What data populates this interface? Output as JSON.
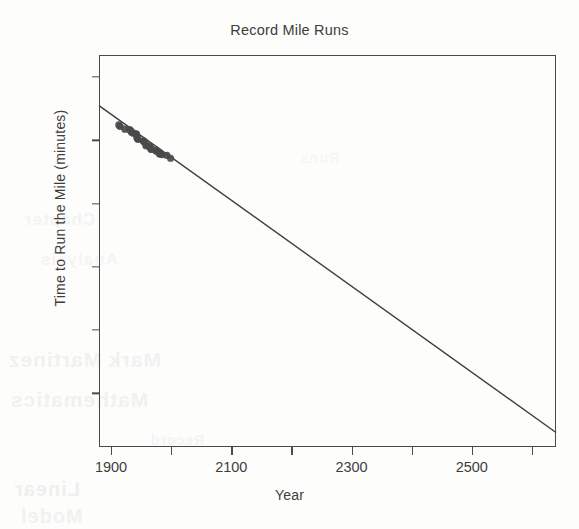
{
  "chart_data": {
    "type": "scatter",
    "title": "Record Mile Runs",
    "xlabel": "Year",
    "ylabel": "Time to Run the Mile (minutes)",
    "xlim": [
      1880,
      2640
    ],
    "ylim": [
      -0.85,
      5.35
    ],
    "grid": false,
    "legend": "none",
    "x_ticks": [
      {
        "value": 1900,
        "label": "1900"
      },
      {
        "value": 2000,
        "label": ""
      },
      {
        "value": 2100,
        "label": "2100"
      },
      {
        "value": 2200,
        "label": ""
      },
      {
        "value": 2300,
        "label": "2300"
      },
      {
        "value": 2400,
        "label": ""
      },
      {
        "value": 2500,
        "label": "2500"
      },
      {
        "value": 2600,
        "label": ""
      }
    ],
    "y_ticks": [
      {
        "value": 0,
        "label": "0"
      },
      {
        "value": 1,
        "label": "1"
      },
      {
        "value": 2,
        "label": "2"
      },
      {
        "value": 3,
        "label": "3"
      },
      {
        "value": 4,
        "label": "4"
      },
      {
        "value": 5,
        "label": "5"
      }
    ],
    "series": [
      {
        "name": "Record mile times",
        "type": "scatter",
        "marker": "circle",
        "color": "#4a4a4a",
        "x": [
          1913,
          1915,
          1923,
          1931,
          1933,
          1934,
          1937,
          1942,
          1942,
          1943,
          1944,
          1945,
          1954,
          1954,
          1957,
          1958,
          1962,
          1964,
          1965,
          1966,
          1967,
          1975,
          1975,
          1979,
          1980,
          1981,
          1981,
          1981,
          1985,
          1993,
          1999
        ],
        "y": [
          4.244,
          4.219,
          4.177,
          4.169,
          4.151,
          4.129,
          4.113,
          4.103,
          4.096,
          4.043,
          4.028,
          4.014,
          3.994,
          3.983,
          3.96,
          3.916,
          3.907,
          3.905,
          3.893,
          3.869,
          3.855,
          3.851,
          3.826,
          3.818,
          3.806,
          3.798,
          3.79,
          3.786,
          3.772,
          3.762,
          3.717
        ]
      },
      {
        "name": "Least-squares regression line",
        "type": "line",
        "color": "#3f3f3f",
        "x_endpoints": [
          1880,
          2640
        ],
        "y_endpoints": [
          4.55,
          -0.62
        ]
      }
    ]
  },
  "ghost_text": {
    "lines": [
      "Mark Martinez",
      "Mathematics",
      "Chapter",
      "Analysis",
      "Linear",
      "Model",
      "Record",
      "Runs"
    ]
  }
}
